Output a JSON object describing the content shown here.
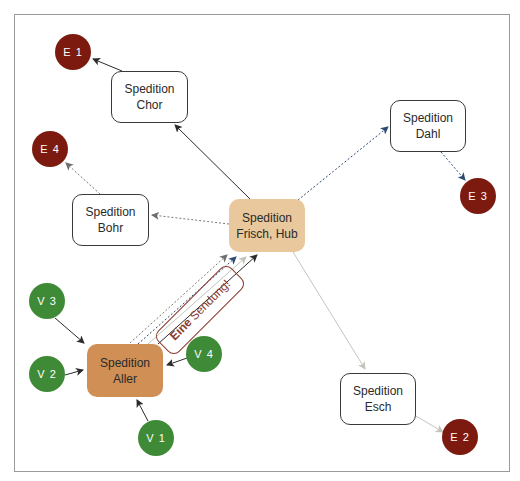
{
  "diagram": {
    "nodes": {
      "chor": {
        "line1": "Spedition",
        "line2": "Chor"
      },
      "bohr": {
        "line1": "Spedition",
        "line2": "Bohr"
      },
      "dahl": {
        "line1": "Spedition",
        "line2": "Dahl"
      },
      "esch": {
        "line1": "Spedition",
        "line2": "Esch"
      },
      "hub": {
        "line1": "Spedition",
        "line2": "Frisch, Hub"
      },
      "aller": {
        "line1": "Spedition",
        "line2": "Aller"
      }
    },
    "destinations": {
      "e1": "E 1",
      "e2": "E 2",
      "e3": "E 3",
      "e4": "E 4"
    },
    "sources": {
      "v1": "V 1",
      "v2": "V 2",
      "v3": "V 3",
      "v4": "V 4"
    },
    "annotation": {
      "bold": "Eine",
      "rest": "Sendung!"
    },
    "edges": [
      {
        "from": "V 1",
        "to": "Spedition Aller",
        "style": "solid-black"
      },
      {
        "from": "V 2",
        "to": "Spedition Aller",
        "style": "solid-black"
      },
      {
        "from": "V 3",
        "to": "Spedition Aller",
        "style": "solid-black"
      },
      {
        "from": "V 4",
        "to": "Spedition Aller",
        "style": "solid-black"
      },
      {
        "from": "Spedition Aller",
        "to": "Spedition Frisch, Hub",
        "style": "dashed-grey"
      },
      {
        "from": "Spedition Aller",
        "to": "Spedition Frisch, Hub",
        "style": "dashed-blue"
      },
      {
        "from": "Spedition Aller",
        "to": "Spedition Frisch, Hub",
        "style": "solid-lightgrey"
      },
      {
        "from": "Spedition Aller",
        "to": "Spedition Frisch, Hub",
        "style": "solid-black"
      },
      {
        "from": "Spedition Frisch, Hub",
        "to": "Spedition Chor",
        "style": "solid-black"
      },
      {
        "from": "Spedition Frisch, Hub",
        "to": "Spedition Bohr",
        "style": "dashed-grey"
      },
      {
        "from": "Spedition Frisch, Hub",
        "to": "Spedition Dahl",
        "style": "dashed-blue"
      },
      {
        "from": "Spedition Frisch, Hub",
        "to": "Spedition Esch",
        "style": "solid-lightgrey"
      },
      {
        "from": "Spedition Chor",
        "to": "E 1",
        "style": "solid-black"
      },
      {
        "from": "Spedition Bohr",
        "to": "E 4",
        "style": "dashed-grey"
      },
      {
        "from": "Spedition Dahl",
        "to": "E 3",
        "style": "dashed-blue"
      },
      {
        "from": "Spedition Esch",
        "to": "E 2",
        "style": "solid-lightgrey"
      }
    ],
    "colors": {
      "destination": "#7d1a0f",
      "source": "#3f8a36",
      "hub": "#e8c89c",
      "origin": "#cf8f55",
      "annotation": "#8b3a2e",
      "edge_black": "#2b2b2b",
      "edge_grey": "#7a7a7a",
      "edge_blue": "#2e4a72",
      "edge_lightgrey": "#c4c4bd"
    }
  }
}
